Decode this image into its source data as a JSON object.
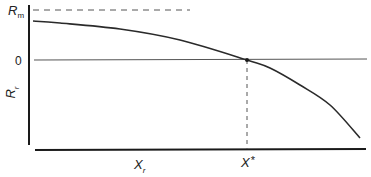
{
  "diagram": {
    "y_axis": {
      "label_main": "R",
      "label_sub": "r",
      "ticks": [
        {
          "main": "R",
          "sub": "m",
          "meaning": "maximum (dashed asymptote)"
        },
        {
          "main": "0",
          "sub": "",
          "meaning": "zero line"
        }
      ]
    },
    "x_axis": {
      "label_main": "X",
      "label_sub": "r",
      "marker_main": "X",
      "marker_sup": "*"
    },
    "colors": {
      "axis": "#1a1a1a",
      "curve": "#2a2a2a",
      "zero_line": "#555555",
      "dashed": "#555555",
      "background": "#ffffff"
    },
    "geometry": {
      "y_axis_x": 29,
      "y_axis_top": 5,
      "y_axis_bottom": 145,
      "x_axis_y": 150,
      "x_axis_left": 35,
      "x_axis_right": 366,
      "rm_y": 10,
      "rm_dash_end": 190,
      "zero_y": 60,
      "zero_right": 367,
      "xstar_x": 247,
      "curve_points": [
        [
          33,
          21
        ],
        [
          60,
          23
        ],
        [
          120,
          29
        ],
        [
          180,
          40
        ],
        [
          247,
          60
        ],
        [
          270,
          68
        ],
        [
          300,
          85
        ],
        [
          330,
          105
        ],
        [
          360,
          138
        ]
      ]
    }
  }
}
